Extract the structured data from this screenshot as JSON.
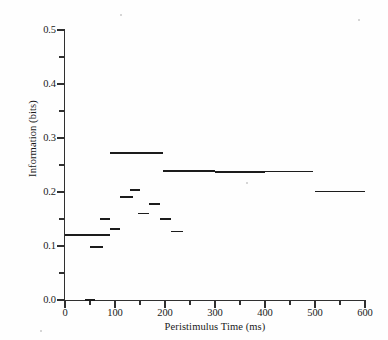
{
  "chart_data": {
    "type": "line",
    "style": "horizontal step segments (binned values)",
    "title": "",
    "xlabel": "Peristimulus Time (ms)",
    "ylabel": "Information (bits)",
    "xlim": [
      0,
      600
    ],
    "ylim": [
      0.0,
      0.5
    ],
    "grid": false,
    "legend": null,
    "x_ticks_major": [
      0,
      100,
      200,
      300,
      400,
      500,
      600
    ],
    "x_tick_labels": [
      "0",
      "100",
      "200",
      "300",
      "400",
      "500",
      "600"
    ],
    "x_ticks_minor": [
      50,
      150,
      250,
      350,
      450,
      550
    ],
    "y_ticks_major": [
      0.0,
      0.1,
      0.2,
      0.3,
      0.4,
      0.5
    ],
    "y_tick_labels": [
      "0.0",
      "0.1",
      "0.2",
      "0.3",
      "0.4",
      "0.5"
    ],
    "y_ticks_minor": [
      0.05,
      0.15,
      0.25,
      0.35,
      0.45
    ],
    "series": [
      {
        "name": "Information",
        "segments": [
          {
            "x_start": 0,
            "x_end": 90,
            "value": 0.12
          },
          {
            "x_start": 40,
            "x_end": 60,
            "value": 0.0
          },
          {
            "x_start": 50,
            "x_end": 75,
            "value": 0.098
          },
          {
            "x_start": 70,
            "x_end": 90,
            "value": 0.15
          },
          {
            "x_start": 90,
            "x_end": 110,
            "value": 0.131
          },
          {
            "x_start": 90,
            "x_end": 195,
            "value": 0.272
          },
          {
            "x_start": 110,
            "x_end": 135,
            "value": 0.191
          },
          {
            "x_start": 130,
            "x_end": 150,
            "value": 0.203
          },
          {
            "x_start": 145,
            "x_end": 168,
            "value": 0.16
          },
          {
            "x_start": 168,
            "x_end": 190,
            "value": 0.178
          },
          {
            "x_start": 190,
            "x_end": 212,
            "value": 0.15
          },
          {
            "x_start": 212,
            "x_end": 235,
            "value": 0.127
          },
          {
            "x_start": 195,
            "x_end": 300,
            "value": 0.239
          },
          {
            "x_start": 300,
            "x_end": 400,
            "value": 0.237
          },
          {
            "x_start": 400,
            "x_end": 495,
            "value": 0.238
          },
          {
            "x_start": 500,
            "x_end": 600,
            "value": 0.201
          }
        ]
      }
    ]
  },
  "figure": {
    "background_color": "#fefefe",
    "ink_color": "#1c1c1c",
    "axis_color": "#303030"
  }
}
